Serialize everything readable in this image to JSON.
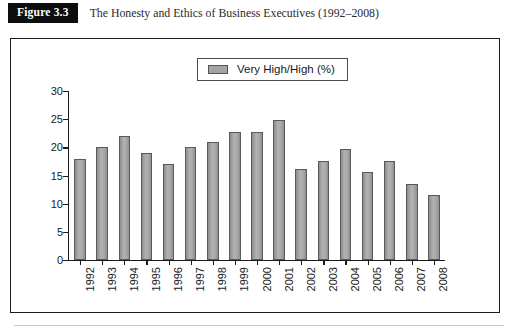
{
  "figure": {
    "badge": "Figure 3.3",
    "caption": "The Honesty and Ethics of Business Executives (1992–2008)"
  },
  "legend": {
    "entries": [
      {
        "label": "Very High/High (%)",
        "color": "#a3a3a3",
        "swatch_icon": "legend-swatch-icon"
      }
    ],
    "position": "top-center",
    "bordered": true
  },
  "chart_data": {
    "type": "bar",
    "title": "The Honesty and Ethics of Business Executives (1992–2008)",
    "xlabel": "",
    "ylabel": "",
    "ylim": [
      0,
      30
    ],
    "yticks": [
      0,
      5,
      10,
      15,
      20,
      25,
      30
    ],
    "ytick_labels": [
      "0",
      "5",
      "10",
      "15",
      "20",
      "25",
      "30"
    ],
    "grid": false,
    "legend_position": "top-center",
    "categories": [
      "1992",
      "1993",
      "1994",
      "1995",
      "1996",
      "1997",
      "1998",
      "1999",
      "2000",
      "2001",
      "2002",
      "2003",
      "2004",
      "2005",
      "2006",
      "2007",
      "2008"
    ],
    "series": [
      {
        "name": "Very High/High (%)",
        "color": "#a3a3a3",
        "values": [
          18.0,
          20.0,
          22.0,
          19.0,
          17.0,
          20.0,
          21.0,
          22.7,
          22.7,
          24.8,
          16.2,
          17.6,
          19.7,
          15.6,
          17.6,
          13.5,
          11.5
        ]
      }
    ]
  }
}
